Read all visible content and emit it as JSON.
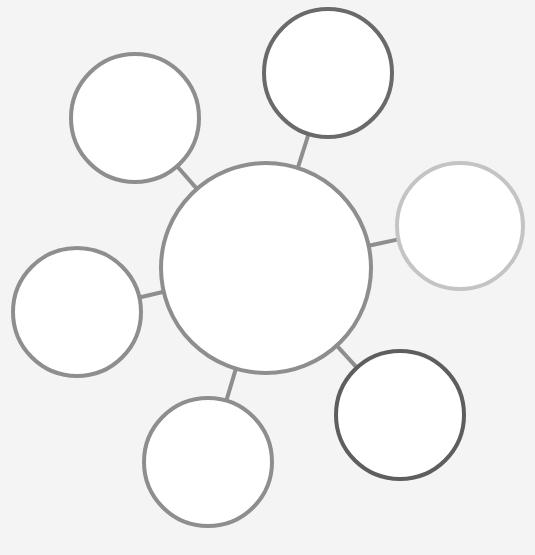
{
  "diagram": {
    "type": "bubble-map",
    "background": "#f4f4f4",
    "fill": "#ffffff",
    "center": {
      "id": "center",
      "cx": 266,
      "cy": 268,
      "r": 105,
      "stroke": "#8e8e8e",
      "label": ""
    },
    "satellites": [
      {
        "id": "top-left",
        "cx": 135,
        "cy": 118,
        "r": 64,
        "stroke": "#8e8e8e",
        "label": ""
      },
      {
        "id": "top",
        "cx": 328,
        "cy": 73,
        "r": 64,
        "stroke": "#6a6a6a",
        "label": ""
      },
      {
        "id": "right",
        "cx": 460,
        "cy": 226,
        "r": 63,
        "stroke": "#c4c4c4",
        "label": ""
      },
      {
        "id": "left",
        "cx": 77,
        "cy": 312,
        "r": 64,
        "stroke": "#8e8e8e",
        "label": ""
      },
      {
        "id": "bottom-right",
        "cx": 400,
        "cy": 415,
        "r": 64,
        "stroke": "#5e5e5e",
        "label": ""
      },
      {
        "id": "bottom",
        "cx": 208,
        "cy": 462,
        "r": 64,
        "stroke": "#8e8e8e",
        "label": ""
      }
    ],
    "connector_color": "#8e8e8e",
    "stroke_width": 4
  }
}
